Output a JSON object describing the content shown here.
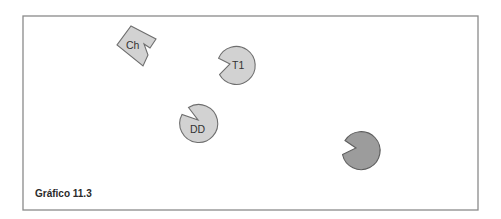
{
  "figure": {
    "caption": "Gráfico 11.3",
    "frame": {
      "x": 23,
      "y": 16,
      "width": 455,
      "height": 194
    },
    "colors": {
      "light_fill": "#d2d2d2",
      "dark_fill": "#9c9c9c",
      "stroke": "#6e6e6e",
      "frame_stroke": "#8a8a8a"
    }
  },
  "shapes": [
    {
      "id": "ch",
      "type": "notched-square",
      "label": "Ch",
      "fill": "light"
    },
    {
      "id": "t1",
      "type": "notched-circle",
      "label": "T1",
      "fill": "light"
    },
    {
      "id": "dd",
      "type": "notched-circle",
      "label": "DD",
      "fill": "light"
    },
    {
      "id": "unlabeled",
      "type": "notched-circle",
      "label": "",
      "fill": "dark"
    }
  ]
}
